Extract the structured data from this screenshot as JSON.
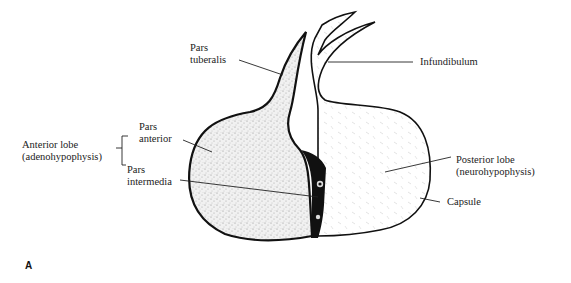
{
  "figure": {
    "panel_label": "A",
    "colors": {
      "ink": "#111111",
      "stipple": "#b8b8b8",
      "background": "#ffffff",
      "text": "#222222"
    }
  },
  "labels": {
    "pars_tuberalis": {
      "line1": "Pars",
      "line2": "tuberalis"
    },
    "infundibulum": "Infundibulum",
    "pars_anterior": {
      "line1": "Pars",
      "line2": "anterior"
    },
    "anterior_lobe": {
      "line1": "Anterior lobe",
      "line2": "(adenohypophysis)"
    },
    "pars_intermedia": {
      "line1": "Pars",
      "line2": "intermedia"
    },
    "posterior_lobe": {
      "line1": "Posterior lobe",
      "line2": "(neurohypophysis)"
    },
    "capsule": "Capsule"
  }
}
